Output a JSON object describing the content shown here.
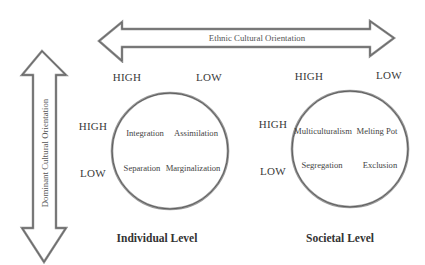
{
  "diagram": {
    "horizontal_arrow": {
      "label": "Ethnic Cultural Orientation"
    },
    "vertical_arrow": {
      "label": "Dominant Cultural Orientation"
    },
    "panels": [
      {
        "title": "Individual Level",
        "column_labels": [
          "HIGH",
          "LOW"
        ],
        "row_labels": [
          "HIGH",
          "LOW"
        ],
        "cells": {
          "high_high": "Integration",
          "high_low": "Assimilation",
          "low_high": "Separation",
          "low_low": "Marginalization"
        }
      },
      {
        "title": "Societal Level",
        "column_labels": [
          "HIGH",
          "LOW"
        ],
        "row_labels": [
          "HIGH",
          "LOW"
        ],
        "cells": {
          "high_high": "Multiculturalism",
          "high_low": "Melting Pot",
          "low_high": "Segregation",
          "low_low": "Exclusion"
        }
      }
    ],
    "colors": {
      "outline": "#6e6e6e",
      "fill": "#ffffff",
      "text": "#3a3a3a"
    }
  }
}
